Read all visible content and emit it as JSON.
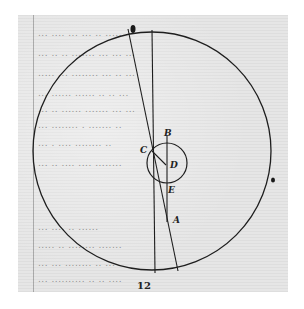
{
  "document": {
    "type": "manuscript-page-with-geometric-diagram",
    "folio_number": "12",
    "handwriting_lines": [
      "...  ....  ...  ... .. ......",
      "... .. .. ....... ... ... ...",
      "..... ... ........ ... .. ...",
      "... ...... ...... .. .. ...",
      "... .. ...... ....... ... ...",
      "... ........ . ....... ..",
      "... . .... ........ ..",
      "... .. .... .... ........",
      "... .... .. ......",
      "..... .. ........ .......",
      "... ... ........ .. ...",
      "... .......... .. .. ...."
    ]
  },
  "diagram": {
    "outer_circle": {
      "cx": 152,
      "cy": 151,
      "r": 119
    },
    "inner_circle": {
      "cx": 167,
      "cy": 163,
      "r": 20
    },
    "lines": [
      {
        "name": "long-chord-through-C",
        "x1": 128,
        "y1": 29,
        "x2": 178,
        "y2": 271
      },
      {
        "name": "near-vertical-line",
        "x1": 152,
        "y1": 30,
        "x2": 155,
        "y2": 273
      },
      {
        "name": "vertical-BA",
        "x1": 167,
        "y1": 135,
        "x2": 167,
        "y2": 222
      },
      {
        "name": "segment-CD",
        "x1": 152,
        "y1": 151,
        "x2": 166,
        "y2": 165
      }
    ],
    "labels": [
      {
        "text": "B",
        "x": 164,
        "y": 128
      },
      {
        "text": "C",
        "x": 140,
        "y": 145
      },
      {
        "text": "D",
        "x": 170,
        "y": 160
      },
      {
        "text": "E",
        "x": 168,
        "y": 185
      },
      {
        "text": "A",
        "x": 173,
        "y": 215
      }
    ],
    "stroke_color": "#1e1e1e"
  }
}
